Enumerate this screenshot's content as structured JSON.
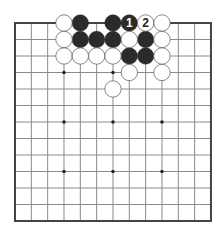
{
  "board": {
    "size": 13,
    "origin_x": 15,
    "origin_y": 23,
    "spacing_x": 16.33,
    "spacing_y": 16.5,
    "stone_radius": 8.2,
    "colors": {
      "line": "#8a8a8a",
      "border": "#444444",
      "black_stone": "#2b2b2b",
      "white_stone": "#ffffff",
      "white_outline": "#555555",
      "star": "#222222"
    },
    "star_points": [
      [
        3,
        3
      ],
      [
        6,
        3
      ],
      [
        9,
        3
      ],
      [
        3,
        6
      ],
      [
        6,
        6
      ],
      [
        9,
        6
      ],
      [
        3,
        9
      ],
      [
        6,
        9
      ],
      [
        9,
        9
      ]
    ],
    "stones": [
      {
        "color": "black",
        "col": 4,
        "row": 0
      },
      {
        "color": "black",
        "col": 6,
        "row": 0
      },
      {
        "color": "black",
        "col": 7,
        "row": 0,
        "label": "1"
      },
      {
        "color": "black",
        "col": 4,
        "row": 1
      },
      {
        "color": "black",
        "col": 5,
        "row": 1
      },
      {
        "color": "black",
        "col": 6,
        "row": 1
      },
      {
        "color": "black",
        "col": 8,
        "row": 1
      },
      {
        "color": "black",
        "col": 7,
        "row": 2
      },
      {
        "color": "black",
        "col": 8,
        "row": 2
      },
      {
        "color": "white",
        "col": 3,
        "row": 0
      },
      {
        "color": "white",
        "col": 8,
        "row": 0,
        "label": "2"
      },
      {
        "color": "white",
        "col": 9,
        "row": 0
      },
      {
        "color": "white",
        "col": 3,
        "row": 1
      },
      {
        "color": "white",
        "col": 7,
        "row": 1
      },
      {
        "color": "white",
        "col": 9,
        "row": 1
      },
      {
        "color": "white",
        "col": 3,
        "row": 2
      },
      {
        "color": "white",
        "col": 4,
        "row": 2
      },
      {
        "color": "white",
        "col": 5,
        "row": 2
      },
      {
        "color": "white",
        "col": 6,
        "row": 2
      },
      {
        "color": "white",
        "col": 9,
        "row": 2
      },
      {
        "color": "white",
        "col": 7,
        "row": 3
      },
      {
        "color": "white",
        "col": 9,
        "row": 3
      },
      {
        "color": "white",
        "col": 6,
        "row": 4
      }
    ]
  }
}
